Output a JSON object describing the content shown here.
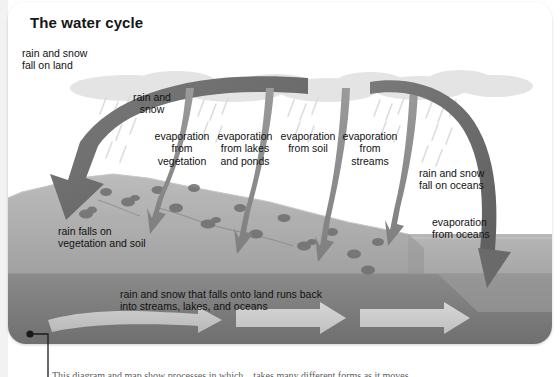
{
  "figure": {
    "title": "The water cycle",
    "caption": "This diagram and map show processes in which... takes many different forms as it moves..."
  },
  "labels": {
    "rain_fall_on_land": "rain and snow\nfall on land",
    "rain_and_snow": "rain and\nsnow",
    "evaporation_from_vegetation": "evaporation\nfrom\nvegetation",
    "evaporation_from_lakes_and_ponds": "evaporation\nfrom lakes\nand ponds",
    "evaporation_from_soil": "evaporation\nfrom soil",
    "evaporation_from_streams": "evaporation\nfrom\nstreams",
    "rain_fall_on_oceans": "rain and snow\nfall on oceans",
    "evaporation_from_oceans": "evaporation\nfrom oceans",
    "rain_falls_on_vegetation_and_soil": "rain falls on\nvegetation and soil",
    "runoff": "rain and snow that falls onto land runs back\ninto streams, lakes, and oceans"
  },
  "colors": {
    "card_background": "#ffffff",
    "title_text": "#161616",
    "label_text": "#111111",
    "big_arrow": "#6a6a6a",
    "evaporation_arrow": "#8e8e8e",
    "land": "#9b9b9b",
    "land_top": "#b4b4b4",
    "subsurface": "#7e7e7e",
    "ocean": "#a6a6a6",
    "cloud": "#e2e2e2",
    "rain_streak": "#d8d8d8",
    "runoff_arrow": "#c9c9c9",
    "callout_line": "#1a1a1a",
    "caption_text": "#5c5c5c"
  }
}
